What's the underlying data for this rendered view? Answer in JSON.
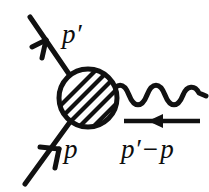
{
  "figure": {
    "name": "feynman-diagram-electromagnetic-vertex",
    "background_color": "#ffffff",
    "ink_color": "#111111",
    "width": 209,
    "height": 192
  },
  "labels": {
    "outgoing_momentum": "p′",
    "incoming_momentum": "p",
    "momentum_transfer_p": "p′",
    "momentum_transfer_op": "−",
    "momentum_transfer_q": "p"
  },
  "elements": {
    "blob": {
      "name": "hatched-blob",
      "shape": "circle",
      "center_x": 88,
      "center_y": 98,
      "radius": 30,
      "fill": "diagonal-hatching",
      "hatch_angle_deg": 45,
      "hatch_count": 9
    },
    "outgoing_fermion_line": {
      "name": "outgoing-fermion-line",
      "from_x": 30,
      "from_y": 17,
      "to_x": 70,
      "to_y": 76,
      "arrow_direction": "up-left",
      "arrow_x": 45,
      "arrow_y": 40
    },
    "incoming_fermion_line": {
      "name": "incoming-fermion-line",
      "from_x": 25,
      "from_y": 183,
      "to_x": 69,
      "to_y": 122,
      "arrow_direction": "up-right",
      "arrow_x": 54,
      "arrow_y": 158
    },
    "photon_line": {
      "name": "photon-wavy-line",
      "from_x": 114,
      "from_y": 96,
      "to_x": 205,
      "to_y": 98,
      "periods": 4,
      "amplitude": 9
    },
    "momentum_transfer_arrow": {
      "name": "momentum-transfer-arrow",
      "from_x": 200,
      "from_y": 121,
      "to_x": 123,
      "to_y": 121,
      "arrow_direction": "left",
      "arrowhead_x": 152
    }
  }
}
